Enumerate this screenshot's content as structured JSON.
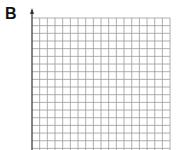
{
  "panel": {
    "label": "B"
  },
  "grid": {
    "columns": 18,
    "rows": 17,
    "cell_size_px": 7.67,
    "origin_x": 32,
    "top_y": 18,
    "line_color": "#9a9a9a",
    "axis_color": "#333333",
    "x_axis_labels": [],
    "y_axis_labels": [],
    "y_axis_arrow": true
  }
}
